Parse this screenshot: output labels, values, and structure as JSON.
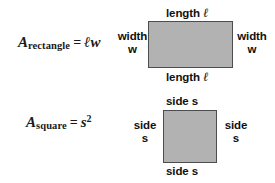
{
  "figure": {
    "background_color": "#ffffff",
    "shape_fill_color": "#b2b2b2",
    "shape_border_color": "#4d4d4d",
    "text_color": "#111111"
  },
  "rectangle": {
    "formula": {
      "variable": "A",
      "subscript": "rectangle",
      "equals": "=",
      "expression": "ℓw"
    },
    "labels": {
      "top": "length",
      "top_symbol": "ℓ",
      "bottom": "length",
      "bottom_symbol": "ℓ",
      "left_line1": "width",
      "left_line2": "w",
      "right_line1": "width",
      "right_line2": "w"
    }
  },
  "square": {
    "formula": {
      "variable": "A",
      "subscript": "square",
      "equals": "=",
      "expression": "s",
      "exponent": "2"
    },
    "labels": {
      "top": "side s",
      "bottom": "side s",
      "left_line1": "side",
      "left_line2": "s",
      "right_line1": "side",
      "right_line2": "s"
    }
  }
}
